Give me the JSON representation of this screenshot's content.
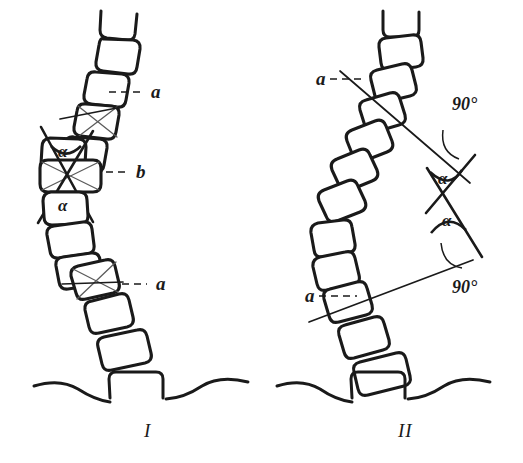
{
  "figure": {
    "title": "",
    "background_color": "#ffffff",
    "ink_color": "#1a1a1a",
    "panels": [
      {
        "id": "panel-1",
        "numeral": "I",
        "numeral_x": 144,
        "numeral_y": 437,
        "labels": [
          {
            "name": "label-a-upper",
            "text": "a",
            "x": 151,
            "y": 98,
            "leader_from_x": 109,
            "leader_from_y": 92,
            "leader_to_x": 141,
            "leader_to_y": 92
          },
          {
            "name": "label-b",
            "text": "b",
            "x": 136,
            "y": 178,
            "leader_from_x": 94,
            "leader_from_y": 172,
            "leader_to_x": 127,
            "leader_to_y": 172
          },
          {
            "name": "label-a-lower",
            "text": "a",
            "x": 156,
            "y": 290,
            "leader_from_x": 112,
            "leader_from_y": 284,
            "leader_to_x": 147,
            "leader_to_y": 284
          }
        ],
        "alpha_labels": [
          {
            "name": "alpha-upper",
            "text": "α",
            "x": 64,
            "y": 155
          },
          {
            "name": "alpha-lower",
            "text": "α",
            "x": 64,
            "y": 208
          }
        ]
      },
      {
        "id": "panel-2",
        "numeral": "II",
        "numeral_x": 400,
        "numeral_y": 437,
        "labels": [
          {
            "name": "label-a-upper",
            "text": "a",
            "x": 316,
            "y": 85,
            "leader_from_x": 330,
            "leader_from_y": 79,
            "leader_to_x": 364,
            "leader_to_y": 79
          },
          {
            "name": "label-a-lower",
            "text": "a",
            "x": 305,
            "y": 302,
            "leader_from_x": 320,
            "leader_from_y": 296,
            "leader_to_x": 358,
            "leader_to_y": 296
          }
        ],
        "alpha_labels": [
          {
            "name": "alpha-upper",
            "text": "α",
            "x": 444,
            "y": 182
          },
          {
            "name": "alpha-lower",
            "text": "α",
            "x": 449,
            "y": 222
          }
        ],
        "angle_labels": [
          {
            "name": "angle-90-upper",
            "text": "90°",
            "x": 456,
            "y": 107
          },
          {
            "name": "angle-90-lower",
            "text": "90°",
            "x": 456,
            "y": 290
          }
        ]
      }
    ]
  }
}
